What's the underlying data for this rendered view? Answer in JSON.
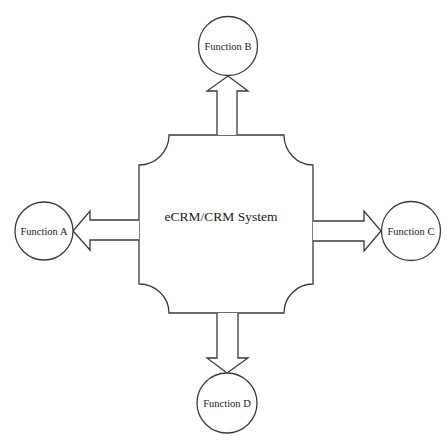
{
  "diagram": {
    "title_fragment": "Figure: eCRM/CRM System and its functions",
    "center": {
      "label": "eCRM/CRM System"
    },
    "nodes": [
      {
        "id": "A",
        "label": "Function A",
        "position": "left"
      },
      {
        "id": "B",
        "label": "Function B",
        "position": "top"
      },
      {
        "id": "C",
        "label": "Function C",
        "position": "right"
      },
      {
        "id": "D",
        "label": "Function D",
        "position": "bottom"
      }
    ],
    "edges": [
      {
        "from": "eCRM/CRM System",
        "to": "Function A",
        "type": "block-arrow"
      },
      {
        "from": "eCRM/CRM System",
        "to": "Function B",
        "type": "block-arrow"
      },
      {
        "from": "eCRM/CRM System",
        "to": "Function C",
        "type": "block-arrow"
      },
      {
        "from": "eCRM/CRM System",
        "to": "Function D",
        "type": "block-arrow"
      }
    ],
    "colors": {
      "stroke": "#3a3a3a",
      "fill": "#ffffff",
      "text": "#1a1a1a"
    }
  }
}
